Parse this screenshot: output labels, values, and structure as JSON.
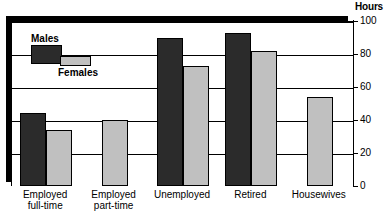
{
  "chart_data": {
    "type": "bar",
    "title": "",
    "xlabel": "",
    "ylabel": "Hours",
    "ylim": [
      0,
      100
    ],
    "ytick_values": [
      0,
      20,
      40,
      60,
      80,
      100
    ],
    "ytick_labels": [
      "0",
      "20",
      "40",
      "60",
      "80",
      "100"
    ],
    "grid": true,
    "legend_position": "upper-left-inside",
    "categories": [
      "Employed\nfull-time",
      "Employed\npart-time",
      "Unemployed",
      "Retired",
      "Housewives"
    ],
    "series": [
      {
        "name": "Males",
        "color": "#2b2b2b",
        "values": [
          44,
          null,
          90,
          93,
          null
        ]
      },
      {
        "name": "Females",
        "color": "#c0c0c0",
        "values": [
          34,
          40,
          73,
          82,
          54
        ]
      }
    ]
  },
  "axis": {
    "hours_label": "Hours"
  },
  "legend": {
    "males_label": "Males",
    "females_label": "Females"
  }
}
